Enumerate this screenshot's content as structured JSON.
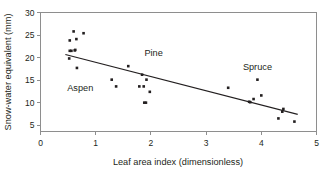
{
  "chart_data": {
    "type": "scatter",
    "title": "",
    "xlabel": "Leaf area index (dimensionless)",
    "ylabel": "Snow-water equivalent (mm)",
    "xlim": [
      0,
      5
    ],
    "ylim": [
      3.6,
      30
    ],
    "xticks": [
      0,
      1,
      2,
      3,
      4,
      5
    ],
    "yticks": [
      5,
      10,
      15,
      20,
      25,
      30
    ],
    "xtick_labels": [
      "0",
      "1",
      "2",
      "3",
      "4",
      "5"
    ],
    "ytick_labels": [
      "5",
      "10",
      "15",
      "20",
      "25",
      "30"
    ],
    "grid": false,
    "legend": "none",
    "point_color": "#231f20",
    "line_color": "#231f20",
    "axis_color": "#8e8e8e",
    "series": [
      {
        "name": "Snow-water equivalent vs leaf area index",
        "marker": "square",
        "points": [
          {
            "x": 0.52,
            "y": 19.8
          },
          {
            "x": 0.53,
            "y": 21.5
          },
          {
            "x": 0.53,
            "y": 23.8
          },
          {
            "x": 0.56,
            "y": 21.5
          },
          {
            "x": 0.6,
            "y": 25.8
          },
          {
            "x": 0.62,
            "y": 21.6
          },
          {
            "x": 0.63,
            "y": 21.7
          },
          {
            "x": 0.65,
            "y": 24.1
          },
          {
            "x": 0.66,
            "y": 17.7
          },
          {
            "x": 0.78,
            "y": 25.4
          },
          {
            "x": 1.29,
            "y": 15.1
          },
          {
            "x": 1.37,
            "y": 13.6
          },
          {
            "x": 1.59,
            "y": 18.1
          },
          {
            "x": 1.79,
            "y": 13.6
          },
          {
            "x": 1.84,
            "y": 16.2
          },
          {
            "x": 1.87,
            "y": 13.6
          },
          {
            "x": 1.88,
            "y": 10.0
          },
          {
            "x": 1.91,
            "y": 10.0
          },
          {
            "x": 1.92,
            "y": 15.1
          },
          {
            "x": 1.98,
            "y": 12.4
          },
          {
            "x": 3.4,
            "y": 13.3
          },
          {
            "x": 3.78,
            "y": 10.2
          },
          {
            "x": 3.8,
            "y": 10.1
          },
          {
            "x": 3.86,
            "y": 10.8
          },
          {
            "x": 3.93,
            "y": 15.1
          },
          {
            "x": 4.0,
            "y": 11.6
          },
          {
            "x": 4.31,
            "y": 6.5
          },
          {
            "x": 4.38,
            "y": 8.0
          },
          {
            "x": 4.4,
            "y": 8.6
          },
          {
            "x": 4.6,
            "y": 5.8
          }
        ]
      }
    ],
    "trend_line": {
      "name": "linear-fit",
      "x_start": 0.45,
      "y_start": 20.7,
      "x_end": 4.66,
      "y_end": 7.4
    },
    "annotations": [
      {
        "text": "Aspen",
        "x": 0.72,
        "y": 13.3
      },
      {
        "text": "Pine",
        "x": 2.05,
        "y": 21.1
      },
      {
        "text": "Spruce",
        "x": 3.93,
        "y": 18.0
      }
    ]
  }
}
